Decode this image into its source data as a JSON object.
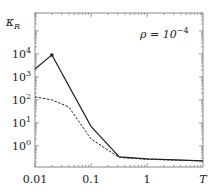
{
  "chart_data": {
    "type": "line",
    "title": "",
    "xlabel": "T",
    "ylabel": "κ_R",
    "xscale": "log",
    "yscale": "log",
    "xlim": [
      0.01,
      10
    ],
    "ylim": [
      0.12,
      600000
    ],
    "x_ticks": [
      {
        "value": 0.01,
        "label": "0.01"
      },
      {
        "value": 0.1,
        "label": "0.1"
      },
      {
        "value": 1,
        "label": "1"
      },
      {
        "value": 10,
        "label": "T"
      }
    ],
    "y_ticks": [
      {
        "value": 1,
        "base": "10",
        "exp": "0"
      },
      {
        "value": 10,
        "base": "10",
        "exp": "1"
      },
      {
        "value": 100,
        "base": "10",
        "exp": "2"
      },
      {
        "value": 1000,
        "base": "10",
        "exp": "3"
      },
      {
        "value": 10000,
        "base": "10",
        "exp": "4"
      }
    ],
    "annotation": {
      "prefix": "ρ = 10",
      "exp": "−4",
      "position": "top-right"
    },
    "ylabel_main": "κ",
    "ylabel_sub": "R",
    "grid": false,
    "legend": null,
    "series": [
      {
        "name": "solid",
        "style": "solid",
        "color": "#222222",
        "x": [
          0.01,
          0.02,
          0.1,
          0.32,
          1,
          10
        ],
        "y": [
          2200,
          9000,
          7,
          0.33,
          0.27,
          0.22
        ],
        "marker_at": [
          1
        ]
      },
      {
        "name": "dashed",
        "style": "dashed",
        "color": "#222222",
        "x": [
          0.01,
          0.02,
          0.04,
          0.1,
          0.32,
          1,
          10
        ],
        "y": [
          135,
          100,
          50,
          2,
          0.31,
          0.26,
          0.22
        ],
        "marker_at": []
      }
    ]
  }
}
